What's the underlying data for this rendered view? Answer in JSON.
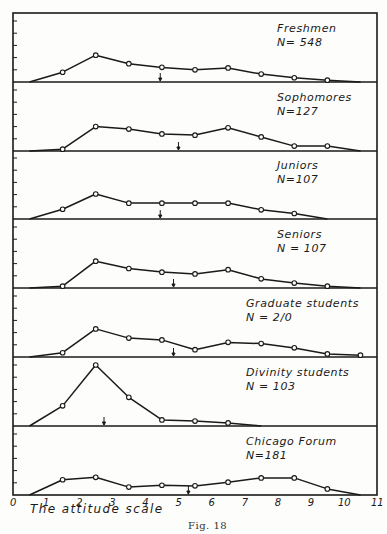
{
  "chart_data": {
    "type": "line",
    "title": "",
    "caption": "Fig. 18",
    "xlabel": "The attitude scale",
    "ylabel": "",
    "xlim": [
      0,
      11
    ],
    "x_ticks": [
      "0",
      "1",
      "2",
      "3",
      "4",
      "5",
      "6",
      "7",
      "8",
      "9",
      "10",
      "11"
    ],
    "y_ticks_per_panel": 5,
    "grid": false,
    "legend_position": "per-panel, upper right",
    "panels": [
      {
        "name": "Freshmen",
        "n_label": "N= 548",
        "x": [
          0.5,
          1.5,
          2.5,
          3.5,
          4.5,
          5.5,
          6.5,
          7.5,
          8.5,
          9.5,
          10.5
        ],
        "values": [
          0,
          0.8,
          2.2,
          1.5,
          1.2,
          1.0,
          1.15,
          0.65,
          0.35,
          0.15,
          0
        ],
        "marked": [
          false,
          true,
          true,
          true,
          true,
          true,
          true,
          true,
          true,
          true,
          false
        ],
        "median_arrow": 4.45
      },
      {
        "name": "Sophomores",
        "n_label": "N=127",
        "x": [
          0.5,
          1.5,
          2.5,
          3.5,
          4.5,
          5.5,
          6.5,
          7.5,
          8.5,
          9.5,
          10.5
        ],
        "values": [
          0,
          0.15,
          2.0,
          1.8,
          1.4,
          1.3,
          1.9,
          1.15,
          0.4,
          0.4,
          0
        ],
        "marked": [
          false,
          true,
          true,
          true,
          true,
          true,
          true,
          true,
          true,
          true,
          false
        ],
        "median_arrow": 5.0
      },
      {
        "name": "Juniors",
        "n_label": "N=107",
        "x": [
          0.5,
          1.5,
          2.5,
          3.5,
          4.5,
          5.5,
          6.5,
          7.5,
          8.5,
          9.5
        ],
        "values": [
          0,
          0.8,
          2.05,
          1.3,
          1.3,
          1.3,
          1.3,
          0.75,
          0.45,
          0
        ],
        "marked": [
          false,
          true,
          true,
          true,
          true,
          true,
          true,
          true,
          true,
          false
        ],
        "median_arrow": 4.45
      },
      {
        "name": "Seniors",
        "n_label": "N = 107",
        "x": [
          0.5,
          1.5,
          2.5,
          3.5,
          4.5,
          5.5,
          6.5,
          7.5,
          8.5,
          9.5,
          10.5
        ],
        "values": [
          0,
          0.15,
          2.2,
          1.6,
          1.3,
          1.15,
          1.5,
          0.75,
          0.4,
          0.15,
          0
        ],
        "marked": [
          false,
          true,
          true,
          true,
          true,
          true,
          true,
          true,
          true,
          true,
          false
        ],
        "median_arrow": 4.85
      },
      {
        "name": "Graduate students",
        "n_label": "N = 2/0",
        "x": [
          0.5,
          1.5,
          2.5,
          3.5,
          4.5,
          5.5,
          6.5,
          7.5,
          8.5,
          9.5,
          10.5
        ],
        "values": [
          0,
          0.35,
          2.3,
          1.55,
          1.4,
          0.6,
          1.2,
          1.1,
          0.75,
          0.25,
          0.15
        ],
        "marked": [
          false,
          true,
          true,
          true,
          true,
          true,
          true,
          true,
          true,
          true,
          true
        ],
        "median_arrow": 4.85
      },
      {
        "name": "Divinity students",
        "n_label": "N = 103",
        "x": [
          0.5,
          1.5,
          2.5,
          3.5,
          4.5,
          5.5,
          6.5,
          7.5
        ],
        "values": [
          0,
          1.65,
          5.0,
          2.35,
          0.5,
          0.4,
          0.25,
          0
        ],
        "marked": [
          false,
          true,
          true,
          true,
          true,
          true,
          true,
          false
        ],
        "median_arrow": 2.75
      },
      {
        "name": "Chicago Forum",
        "n_label": "N=181",
        "x": [
          0.5,
          1.5,
          2.5,
          3.5,
          4.5,
          5.5,
          6.5,
          7.5,
          8.5,
          9.5,
          10.5
        ],
        "values": [
          0,
          1.25,
          1.45,
          0.65,
          0.8,
          0.75,
          1.05,
          1.4,
          1.4,
          0.5,
          0
        ],
        "marked": [
          false,
          true,
          true,
          true,
          true,
          true,
          true,
          true,
          true,
          true,
          false
        ],
        "median_arrow": 5.3
      }
    ]
  }
}
